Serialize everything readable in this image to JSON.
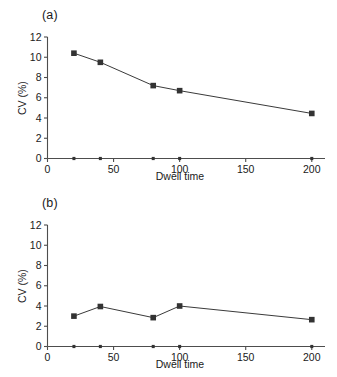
{
  "figure": {
    "panels": [
      {
        "label": "(a)",
        "xlabel": "Dwell time",
        "ylabel": "CV (%)"
      },
      {
        "label": "(b)",
        "xlabel": "Dwell time",
        "ylabel": "CV (%)"
      }
    ]
  },
  "chart_data": [
    {
      "type": "line",
      "title": "(a)",
      "xlabel": "Dwell time",
      "ylabel": "CV (%)",
      "x": [
        20,
        40,
        80,
        100,
        200
      ],
      "values": [
        10.4,
        9.5,
        7.2,
        6.7,
        4.45
      ],
      "xlim": [
        0,
        210
      ],
      "ylim": [
        0,
        12
      ],
      "xticks": [
        0,
        50,
        100,
        150,
        200
      ],
      "xticklabels": [
        "0",
        "50",
        "100",
        "150",
        "200"
      ],
      "yticks": [
        0,
        2,
        4,
        6,
        8,
        10,
        12
      ],
      "yticklabels": [
        "0",
        "2",
        "4",
        "6",
        "8",
        "10",
        "12"
      ],
      "minor_xticks": [
        20,
        40,
        80,
        100,
        200
      ],
      "grid": false,
      "legend": null,
      "marker": "square",
      "series_color": "#333333"
    },
    {
      "type": "line",
      "title": "(b)",
      "xlabel": "Dwell time",
      "ylabel": "CV (%)",
      "x": [
        20,
        40,
        80,
        100,
        200
      ],
      "values": [
        3.0,
        3.95,
        2.85,
        4.0,
        2.65
      ],
      "xlim": [
        0,
        210
      ],
      "ylim": [
        0,
        12
      ],
      "xticks": [
        0,
        50,
        100,
        150,
        200
      ],
      "xticklabels": [
        "0",
        "50",
        "100",
        "150",
        "200"
      ],
      "yticks": [
        0,
        2,
        4,
        6,
        8,
        10,
        12
      ],
      "yticklabels": [
        "0",
        "2",
        "4",
        "6",
        "8",
        "10",
        "12"
      ],
      "minor_xticks": [
        20,
        40,
        80,
        100,
        200
      ],
      "grid": false,
      "legend": null,
      "marker": "square",
      "series_color": "#333333"
    }
  ]
}
